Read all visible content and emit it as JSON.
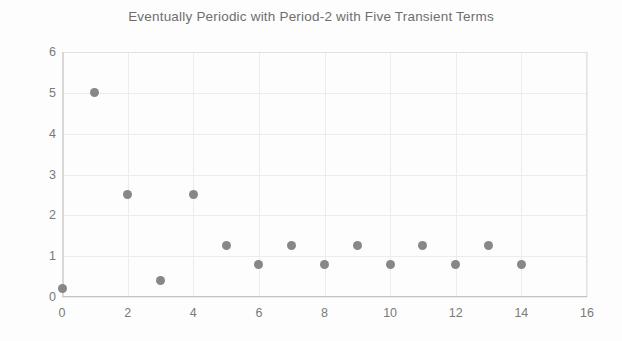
{
  "chart_data": {
    "type": "scatter",
    "title": "Eventually Periodic with Period-2 with Five Transient Terms",
    "xlabel": "",
    "ylabel": "",
    "x": [
      0,
      1,
      2,
      3,
      4,
      5,
      6,
      7,
      8,
      9,
      10,
      11,
      12,
      13,
      14
    ],
    "values": [
      0.2,
      5,
      2.5,
      0.4,
      2.5,
      1.25,
      0.8,
      1.25,
      0.8,
      1.25,
      0.8,
      1.25,
      0.8,
      1.25,
      0.8
    ],
    "xlim": [
      0,
      16
    ],
    "ylim": [
      0,
      6
    ],
    "x_ticks": [
      0,
      2,
      4,
      6,
      8,
      10,
      12,
      14,
      16
    ],
    "x_tick_labels": [
      "0",
      "2",
      "4",
      "6",
      "8",
      "10",
      "12",
      "14",
      "16"
    ],
    "y_ticks": [
      0,
      1,
      2,
      3,
      4,
      5,
      6
    ],
    "y_tick_labels": [
      "0",
      "1",
      "2",
      "3",
      "4",
      "5",
      "6"
    ],
    "grid": true,
    "legend": null,
    "marker_color": "#878787",
    "grid_color": "#ececec",
    "axis_color": "#c4c4c4",
    "title_color": "#6e6e6e",
    "tick_label_color": "#7a7a7a",
    "background_color": "#fdfdfd"
  }
}
